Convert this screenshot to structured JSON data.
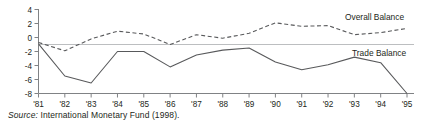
{
  "figure": {
    "source_lead": "Source:",
    "source_text": " International Monetary Fund (1998)."
  },
  "chart_data": {
    "type": "line",
    "title": "",
    "subtitle": "",
    "xlabel": "",
    "ylabel": "",
    "grid": false,
    "legend_position": "inline-right",
    "zero_line": true,
    "x": [
      "'81",
      "'82",
      "'83",
      "'84",
      "'85",
      "'86",
      "'87",
      "'88",
      "'89",
      "'90",
      "'91",
      "'92",
      "'93",
      "'94",
      "'95"
    ],
    "categories": [
      "'81",
      "'82",
      "'83",
      "'84",
      "'85",
      "'86",
      "'87",
      "'88",
      "'89",
      "'90",
      "'91",
      "'92",
      "'93",
      "'94",
      "'95"
    ],
    "xlim": [
      0,
      14
    ],
    "ylim": [
      -8,
      4
    ],
    "yticks": [
      4,
      2,
      0,
      -2,
      -4,
      -6,
      -8
    ],
    "ytick_labels": [
      "4",
      "2",
      "0",
      "-2",
      "-4",
      "-6",
      "-8"
    ],
    "series": [
      {
        "name": "Overall Balance",
        "style": "dashed",
        "color": "#58595b",
        "label_x": "'94",
        "values": [
          -0.7,
          -1.9,
          -0.2,
          0.9,
          0.5,
          -1.0,
          0.4,
          -0.1,
          0.6,
          2.1,
          1.6,
          1.7,
          0.4,
          0.7,
          1.3
        ]
      },
      {
        "name": "Trade Balance",
        "style": "solid",
        "color": "#58595b",
        "label_x": "'93",
        "values": [
          -0.9,
          -5.5,
          -6.5,
          -2.0,
          -2.0,
          -4.2,
          -2.5,
          -1.8,
          -1.5,
          -3.5,
          -4.6,
          -3.9,
          -2.8,
          -3.6,
          -8.0
        ]
      }
    ]
  },
  "axes": {
    "ytick_labels": [
      "4",
      "2",
      "0",
      "-2",
      "-4",
      "-6",
      "-8"
    ],
    "xtick_labels": [
      "'81",
      "'82",
      "'83",
      "'84",
      "'85",
      "'86",
      "'87",
      "'88",
      "'89",
      "'90",
      "'91",
      "'92",
      "'93",
      "'94",
      "'95"
    ]
  },
  "legend": {
    "overall": "Overall Balance",
    "trade": "Trade Balance"
  },
  "colors": {
    "line": "#58595b",
    "axis": "#808285",
    "zero": "#bcbec0",
    "text": "#231f20"
  }
}
